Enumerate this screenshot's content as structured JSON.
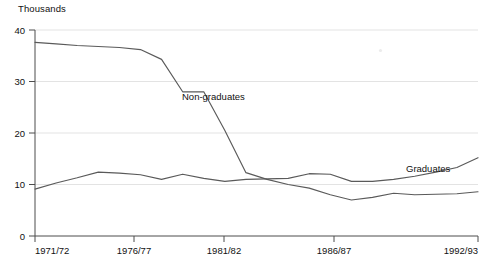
{
  "chart_data": {
    "type": "line",
    "title": "",
    "unit_label": "Thousands",
    "xlabel": "",
    "ylabel": "Thousands",
    "grid": true,
    "legend_position": "inline-annotation",
    "ylim": [
      0,
      40
    ],
    "y_ticks": [
      "0",
      "10",
      "20",
      "30",
      "40"
    ],
    "y_tick_values": [
      0,
      10,
      20,
      30,
      40
    ],
    "x_tick_labels": [
      "1971/72",
      "1976/77",
      "1981/82",
      "1986/87",
      "1992/93"
    ],
    "x_tick_years": [
      "1971/72",
      "1976/77",
      "1981/82",
      "1986/87",
      "1992/93"
    ],
    "x": [
      "1971/72",
      "1972/73",
      "1973/74",
      "1974/75",
      "1975/76",
      "1976/77",
      "1977/78",
      "1978/79",
      "1979/80",
      "1980/81",
      "1981/82",
      "1982/83",
      "1983/84",
      "1984/85",
      "1985/86",
      "1986/87",
      "1987/88",
      "1988/89",
      "1989/90",
      "1990/91",
      "1991/92",
      "1992/93"
    ],
    "series": [
      {
        "name": "Non-graduates",
        "label": "Non-graduates",
        "values": [
          37.6,
          37.3,
          37.0,
          36.8,
          36.6,
          36.2,
          34.3,
          28.0,
          28.0,
          20.5,
          12.3,
          11.0,
          10.0,
          9.3,
          8.0,
          7.0,
          7.5,
          8.3,
          8.0,
          8.1,
          8.2,
          8.6
        ]
      },
      {
        "name": "Graduates",
        "label": "Graduates",
        "values": [
          9.1,
          10.3,
          11.3,
          12.4,
          12.2,
          11.9,
          11.0,
          12.0,
          11.2,
          10.6,
          11.0,
          11.1,
          11.2,
          12.1,
          12.0,
          10.6,
          10.6,
          11.0,
          11.6,
          12.4,
          13.3,
          15.2
        ]
      }
    ],
    "annotations": [
      {
        "text": "Non-graduates",
        "x_px": 182,
        "y_px": 100
      },
      {
        "text": "Graduates",
        "x_px": 406,
        "y_px": 172
      }
    ]
  }
}
